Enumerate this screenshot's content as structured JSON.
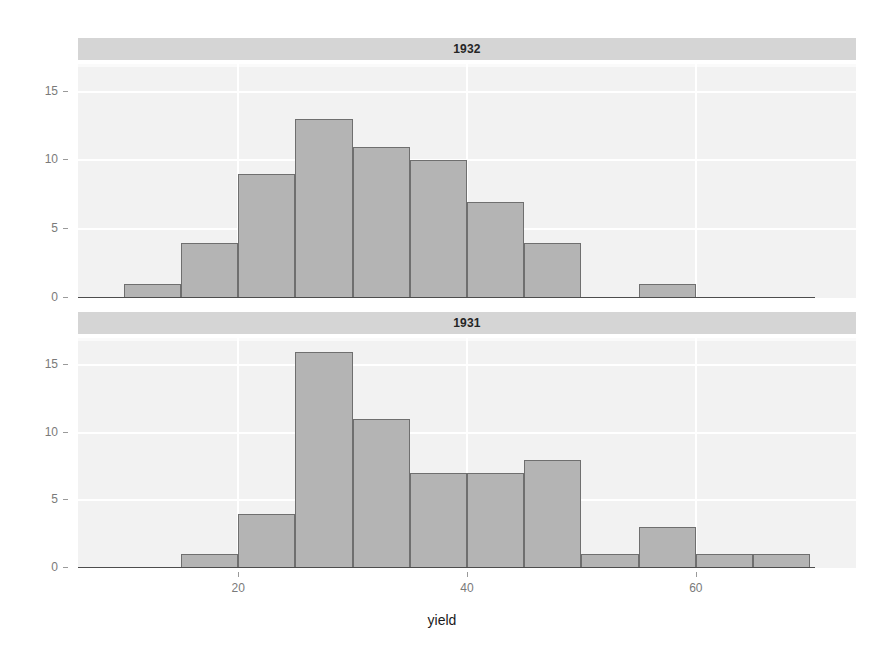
{
  "figure": {
    "background_color": "#ffffff",
    "panel_background_color": "#f2f2f2",
    "strip_background_color": "#d5d5d5",
    "bar_fill_color": "#b4b4b4",
    "bar_border_color": "#6f6f6f",
    "gridline_color": "#ffffff",
    "axis_color": "#4d4d4d"
  },
  "chart_data": {
    "type": "bar",
    "title": "",
    "subtitle": "",
    "xlabel": "yield",
    "ylabel": "",
    "xlim": [
      6,
      74
    ],
    "ylim": [
      0,
      17
    ],
    "xticks": [
      20,
      40,
      60
    ],
    "xtick_labels": [
      "20",
      "40",
      "60"
    ],
    "yticks": [
      0,
      5,
      10,
      15
    ],
    "ytick_labels": [
      "0",
      "5",
      "10",
      "15"
    ],
    "grid": true,
    "legend": "none",
    "facet_variable": "year",
    "bin_width": 5,
    "panels": [
      {
        "strip_label": "1932",
        "bins": [
          {
            "x0": 10,
            "x1": 15,
            "count": 1
          },
          {
            "x0": 15,
            "x1": 20,
            "count": 4
          },
          {
            "x0": 20,
            "x1": 25,
            "count": 9
          },
          {
            "x0": 25,
            "x1": 30,
            "count": 13
          },
          {
            "x0": 30,
            "x1": 35,
            "count": 11
          },
          {
            "x0": 35,
            "x1": 40,
            "count": 10
          },
          {
            "x0": 40,
            "x1": 45,
            "count": 7
          },
          {
            "x0": 45,
            "x1": 50,
            "count": 4
          },
          {
            "x0": 55,
            "x1": 60,
            "count": 1
          }
        ]
      },
      {
        "strip_label": "1931",
        "bins": [
          {
            "x0": 15,
            "x1": 20,
            "count": 1
          },
          {
            "x0": 20,
            "x1": 25,
            "count": 4
          },
          {
            "x0": 25,
            "x1": 30,
            "count": 16
          },
          {
            "x0": 30,
            "x1": 35,
            "count": 11
          },
          {
            "x0": 35,
            "x1": 40,
            "count": 7
          },
          {
            "x0": 40,
            "x1": 45,
            "count": 7
          },
          {
            "x0": 45,
            "x1": 50,
            "count": 8
          },
          {
            "x0": 50,
            "x1": 55,
            "count": 1
          },
          {
            "x0": 55,
            "x1": 60,
            "count": 3
          },
          {
            "x0": 60,
            "x1": 65,
            "count": 1
          },
          {
            "x0": 65,
            "x1": 70,
            "count": 1
          }
        ]
      }
    ]
  }
}
